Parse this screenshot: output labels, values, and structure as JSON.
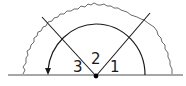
{
  "diagram": {
    "type": "angle-diagram",
    "angle_labels": {
      "angle1": "1",
      "angle2": "2",
      "angle3": "3"
    },
    "colors": {
      "line": "#1a1a1a",
      "wavy": "#444444",
      "baseline": "#888888",
      "background": "#ffffff"
    }
  }
}
